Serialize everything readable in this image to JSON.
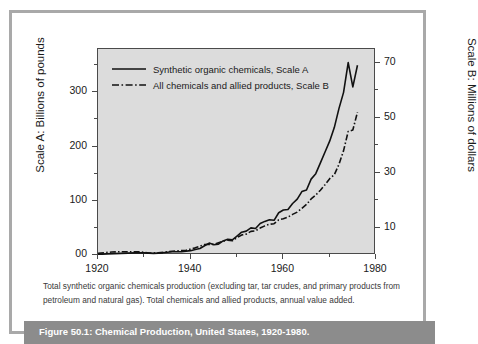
{
  "figure": {
    "bar_label": "Figure 50.1: Chemical Production, United States, 1920-1980.",
    "caption_line1": "Total synthetic organic chemicals production (excluding tar, tar crudes, and primary products from",
    "caption_line2": "petroleum and natural gas). Total chemicals and allied products, annual value added."
  },
  "colors": {
    "plot_background": "#dcdcdc",
    "page_background": "#ffffff",
    "frame_border": "#a9a9a9",
    "axis_line": "#4a4a4a",
    "series_line": "#111111",
    "caption_bar": "#8c8c8c",
    "caption_text": "#ffffff"
  },
  "chart_data": {
    "type": "line",
    "title": "Chemical Production, United States, 1920-1980",
    "xlabel": "",
    "ylabel": "Scale A: Billions of pounds",
    "y2label": "Scale B: Millions of dollars",
    "grid": false,
    "legend_position": "top-left-inside",
    "xlim": [
      1920,
      1980
    ],
    "xticks": [
      1920,
      1940,
      1960,
      1980
    ],
    "xtick_labels": [
      "1920",
      "1940",
      "1960",
      "1980"
    ],
    "xminor_ticks": [
      1930,
      1950,
      1970
    ],
    "ylim": [
      0,
      380
    ],
    "yticks": [
      0,
      100,
      200,
      300
    ],
    "ytick_labels": [
      "00",
      "100",
      "200",
      "300"
    ],
    "yminor_ticks": [
      50,
      150,
      250,
      350
    ],
    "y2lim": [
      0,
      75
    ],
    "y2ticks": [
      10,
      30,
      50,
      70
    ],
    "y2tick_labels": [
      "10",
      "30",
      "50",
      "70"
    ],
    "y2minor_ticks": [
      20,
      40,
      60
    ],
    "series": [
      {
        "name": "Synthetic organic chemicals, Scale A",
        "axis": "A",
        "style": "solid",
        "x": [
          1920,
          1922,
          1925,
          1928,
          1930,
          1932,
          1934,
          1936,
          1938,
          1940,
          1941,
          1942,
          1943,
          1944,
          1945,
          1946,
          1947,
          1948,
          1949,
          1950,
          1951,
          1952,
          1953,
          1954,
          1955,
          1956,
          1957,
          1958,
          1959,
          1960,
          1961,
          1962,
          1963,
          1964,
          1965,
          1966,
          1967,
          1968,
          1969,
          1970,
          1971,
          1972,
          1973,
          1974,
          1975,
          1976
        ],
        "values": [
          1,
          2,
          3,
          4,
          4,
          3,
          4,
          6,
          6,
          8,
          10,
          12,
          17,
          22,
          19,
          20,
          26,
          29,
          28,
          35,
          42,
          44,
          50,
          49,
          58,
          62,
          65,
          64,
          78,
          83,
          84,
          95,
          103,
          117,
          120,
          140,
          150,
          170,
          190,
          210,
          235,
          270,
          300,
          355,
          310,
          350
        ]
      },
      {
        "name": "All chemicals and allied products, Scale B",
        "axis": "B",
        "style": "dash-dot",
        "x": [
          1920,
          1923,
          1925,
          1927,
          1929,
          1931,
          1933,
          1935,
          1937,
          1939,
          1941,
          1943,
          1945,
          1947,
          1948,
          1949,
          1950,
          1951,
          1952,
          1953,
          1954,
          1955,
          1956,
          1957,
          1958,
          1959,
          1960,
          1961,
          1962,
          1963,
          1964,
          1965,
          1966,
          1967,
          1968,
          1969,
          1970,
          1971,
          1972,
          1973,
          1974,
          1975,
          1976
        ],
        "values": [
          0.6,
          1.1,
          1.2,
          1.2,
          1.2,
          0.7,
          0.8,
          1.2,
          1.5,
          1.7,
          2.6,
          3.8,
          3.9,
          5.0,
          5.4,
          5.2,
          6.3,
          7.3,
          7.6,
          8.6,
          8.8,
          9.8,
          10.6,
          11.2,
          11.4,
          12.8,
          13.2,
          13.8,
          14.8,
          15.6,
          17.0,
          18.4,
          20.4,
          21.8,
          23.6,
          25.6,
          27.8,
          29.2,
          33.0,
          38.0,
          45.0,
          45.5,
          52.0
        ]
      }
    ]
  },
  "legend": {
    "items": [
      {
        "label": "Synthetic organic chemicals, Scale A",
        "style": "solid"
      },
      {
        "label": "All chemicals and allied products, Scale B",
        "style": "dash-dot"
      }
    ]
  }
}
